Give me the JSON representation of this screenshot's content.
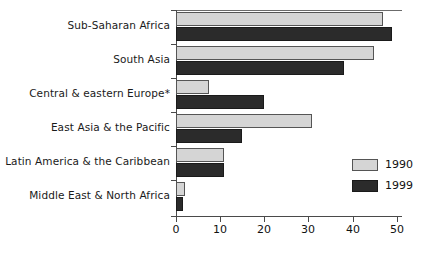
{
  "chart_data": {
    "type": "bar",
    "orientation": "horizontal",
    "title": "",
    "xlabel": "",
    "ylabel": "",
    "xlim": [
      0,
      50
    ],
    "xticks": [
      0,
      10,
      20,
      30,
      40,
      50
    ],
    "xticklabels": [
      "0",
      "10",
      "20",
      "30",
      "40",
      "50"
    ],
    "grid": false,
    "legend_position": "right-middle",
    "categories": [
      "Sub-Saharan Africa",
      "South Asia",
      "Central & eastern Europe*",
      "East Asia & the Pacific",
      "Latin America & the Caribbean",
      "Middle East & North Africa"
    ],
    "series": [
      {
        "name": "1990",
        "color": "#d5d5d5",
        "values": [
          47.0,
          45.0,
          7.5,
          31.0,
          11.0,
          2.0
        ]
      },
      {
        "name": "1999",
        "color": "#2b2b2b",
        "values": [
          49.0,
          38.0,
          20.0,
          15.0,
          11.0,
          1.5
        ]
      }
    ]
  },
  "legend": {
    "items": [
      {
        "label": "1990",
        "swatch": "light-gray-swatch"
      },
      {
        "label": "1999",
        "swatch": "black-swatch"
      }
    ]
  }
}
